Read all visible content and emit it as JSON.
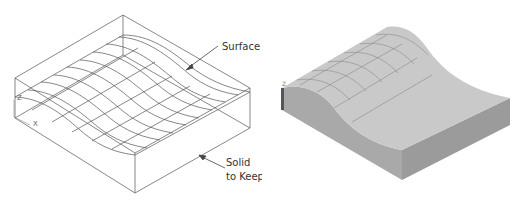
{
  "figure": {
    "left_panel": {
      "view": "wireframe",
      "labels": {
        "surface": "Surface",
        "solid_line1": "Solid",
        "solid_line2": "to Keep"
      },
      "axis_labels": {
        "z": "Z",
        "x": "X"
      }
    },
    "right_panel": {
      "view": "shaded",
      "axis_labels": {
        "z": "Z"
      }
    },
    "colors": {
      "wire": "#555555",
      "face_top": "#c9c9c9",
      "face_front": "#a8a8a8",
      "face_side": "#9a9a9a",
      "grid": "#7a7a7a",
      "text": "#333333"
    }
  }
}
